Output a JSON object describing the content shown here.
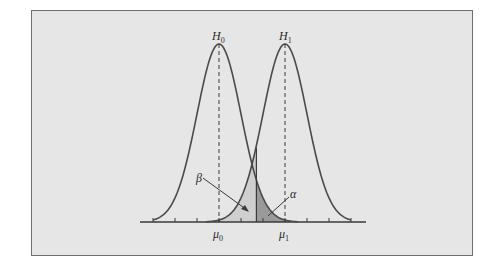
{
  "figure": {
    "background": "#e6e6e6",
    "border_color": "#6e6e6e",
    "curve_color": "#4a4a4a",
    "beta_fill": "#cfcfcf",
    "alpha_fill": "#9a9a9a"
  },
  "chart_data": {
    "type": "line",
    "title": "",
    "xlabel": "",
    "ylabel": "",
    "grid": false,
    "series": [
      {
        "name": "H0",
        "label": "H",
        "subscript": "0",
        "mean_label": "μ",
        "mean_sub": "0",
        "mean": 0,
        "sd": 1
      },
      {
        "name": "H1",
        "label": "H",
        "subscript": "1",
        "mean_label": "μ",
        "mean_sub": "1",
        "mean": 3,
        "sd": 1
      }
    ],
    "critical_value": 1.7,
    "shaded_regions": [
      {
        "name": "beta",
        "label": "β",
        "description": "area under H1 left of critical value"
      },
      {
        "name": "alpha",
        "label": "α",
        "description": "area under H0 right of critical value"
      }
    ],
    "x_ticks": [
      -3,
      -2,
      -1,
      0,
      1,
      2,
      3,
      4,
      5,
      6
    ],
    "xlim": [
      -3.6,
      6.6
    ]
  }
}
